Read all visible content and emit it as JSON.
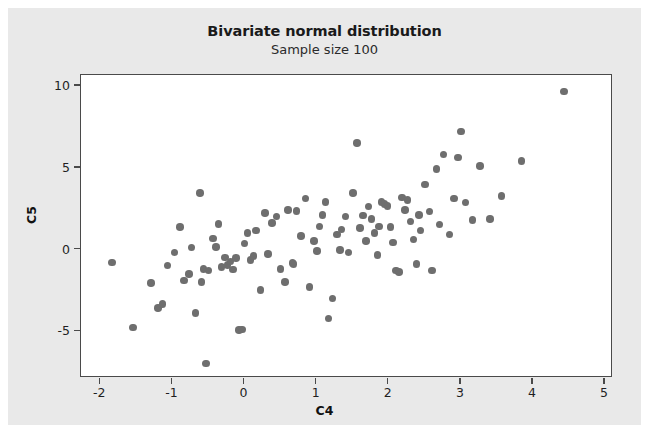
{
  "chart_data": {
    "type": "scatter",
    "title": "Bivariate normal distribution",
    "subtitle": "Sample size 100",
    "xlabel": "C4",
    "ylabel": "C5",
    "xlim": [
      -2.25,
      5.1
    ],
    "ylim": [
      -7.8,
      10.6
    ],
    "xticks": [
      -2,
      -1,
      0,
      1,
      2,
      3,
      4,
      5
    ],
    "xticklabels": [
      "-2",
      "-1",
      "0",
      "1",
      "2",
      "3",
      "4",
      "5"
    ],
    "yticks": [
      -5,
      0,
      5,
      10
    ],
    "yticklabels": [
      "-5",
      "0",
      "5",
      "10"
    ],
    "grid": false,
    "legend": false,
    "marker": {
      "shape": "circle",
      "color": "#6e6e6e",
      "size_px": 7.5
    },
    "n_points": 100,
    "points": [
      [
        -1.82,
        -0.85
      ],
      [
        -1.53,
        -4.85
      ],
      [
        -1.28,
        -2.1
      ],
      [
        -1.18,
        -3.65
      ],
      [
        -1.12,
        -3.4
      ],
      [
        -1.05,
        -1.05
      ],
      [
        -0.95,
        -0.25
      ],
      [
        -0.88,
        1.3
      ],
      [
        -0.82,
        -1.95
      ],
      [
        -0.75,
        -1.55
      ],
      [
        -0.72,
        0.05
      ],
      [
        -0.66,
        -3.95
      ],
      [
        -0.6,
        3.4
      ],
      [
        -0.58,
        -2.05
      ],
      [
        -0.55,
        -1.25
      ],
      [
        -0.52,
        -7.05
      ],
      [
        -0.48,
        -1.35
      ],
      [
        -0.42,
        0.6
      ],
      [
        -0.38,
        0.1
      ],
      [
        -0.34,
        1.5
      ],
      [
        -0.3,
        -1.15
      ],
      [
        -0.25,
        -0.55
      ],
      [
        -0.22,
        -1.0
      ],
      [
        -0.18,
        -0.8
      ],
      [
        -0.14,
        -1.3
      ],
      [
        -0.1,
        -0.6
      ],
      [
        -0.06,
        -5.0
      ],
      [
        -0.02,
        -4.95
      ],
      [
        0.02,
        0.3
      ],
      [
        0.06,
        0.95
      ],
      [
        0.1,
        -0.7
      ],
      [
        0.14,
        -0.45
      ],
      [
        0.18,
        1.1
      ],
      [
        0.24,
        -2.55
      ],
      [
        0.3,
        2.15
      ],
      [
        0.34,
        -0.35
      ],
      [
        0.4,
        1.55
      ],
      [
        0.46,
        1.95
      ],
      [
        0.52,
        -1.25
      ],
      [
        0.58,
        -2.05
      ],
      [
        0.62,
        2.35
      ],
      [
        0.68,
        -0.9
      ],
      [
        0.74,
        2.3
      ],
      [
        0.8,
        0.75
      ],
      [
        0.86,
        3.05
      ],
      [
        0.92,
        -2.35
      ],
      [
        0.98,
        0.45
      ],
      [
        1.02,
        -0.15
      ],
      [
        1.06,
        1.35
      ],
      [
        1.1,
        2.05
      ],
      [
        1.14,
        2.85
      ],
      [
        1.18,
        -4.3
      ],
      [
        1.24,
        -3.05
      ],
      [
        1.3,
        0.85
      ],
      [
        1.36,
        1.15
      ],
      [
        1.42,
        1.95
      ],
      [
        1.46,
        -0.25
      ],
      [
        1.52,
        3.4
      ],
      [
        1.58,
        6.45
      ],
      [
        1.62,
        1.25
      ],
      [
        1.66,
        2.0
      ],
      [
        1.7,
        0.45
      ],
      [
        1.74,
        2.55
      ],
      [
        1.78,
        1.8
      ],
      [
        1.82,
        0.95
      ],
      [
        1.86,
        -0.4
      ],
      [
        1.88,
        1.35
      ],
      [
        1.92,
        2.85
      ],
      [
        1.96,
        2.7
      ],
      [
        2.0,
        2.6
      ],
      [
        2.04,
        1.3
      ],
      [
        2.08,
        0.35
      ],
      [
        2.12,
        -1.35
      ],
      [
        2.16,
        -1.45
      ],
      [
        2.2,
        3.1
      ],
      [
        2.24,
        2.35
      ],
      [
        2.28,
        2.95
      ],
      [
        2.32,
        1.65
      ],
      [
        2.36,
        0.55
      ],
      [
        2.4,
        -0.95
      ],
      [
        2.46,
        1.1
      ],
      [
        2.52,
        3.9
      ],
      [
        2.58,
        2.25
      ],
      [
        2.62,
        -1.35
      ],
      [
        2.68,
        4.85
      ],
      [
        2.72,
        1.45
      ],
      [
        2.78,
        5.75
      ],
      [
        2.86,
        0.85
      ],
      [
        2.92,
        3.05
      ],
      [
        2.98,
        5.55
      ],
      [
        3.02,
        7.15
      ],
      [
        3.08,
        2.8
      ],
      [
        3.18,
        1.75
      ],
      [
        3.28,
        5.05
      ],
      [
        3.42,
        1.8
      ],
      [
        3.58,
        3.2
      ],
      [
        3.86,
        5.35
      ],
      [
        4.45,
        9.6
      ],
      [
        0.7,
        -0.95
      ],
      [
        1.34,
        -0.1
      ],
      [
        2.44,
        2.05
      ]
    ]
  }
}
